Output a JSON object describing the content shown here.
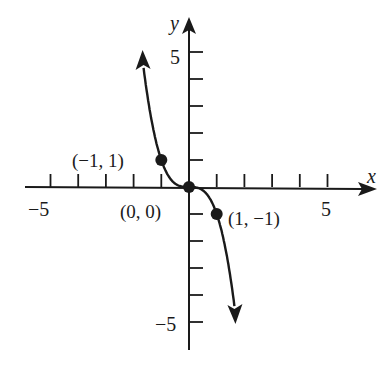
{
  "chart_data": {
    "type": "line",
    "title": "",
    "function": "y = -x^3",
    "xlabel": "x",
    "ylabel": "y",
    "xlim": [
      -6,
      6
    ],
    "ylim": [
      -6,
      6
    ],
    "grid": false,
    "x_tick_labels": [
      {
        "value": -5,
        "text": "−5"
      },
      {
        "value": 5,
        "text": "5"
      }
    ],
    "y_tick_labels": [
      {
        "value": 5,
        "text": "5"
      },
      {
        "value": -5,
        "text": "−5"
      }
    ],
    "x_ticks": [
      -5,
      -4,
      -3,
      -2,
      -1,
      1,
      2,
      3,
      4,
      5
    ],
    "y_ticks": [
      -5,
      -4,
      -3,
      -2,
      -1,
      1,
      2,
      3,
      4,
      5
    ],
    "series": [
      {
        "name": "curve",
        "x": [
          -1.64,
          -1.5,
          -1.25,
          -1,
          -0.75,
          -0.5,
          -0.25,
          0,
          0.25,
          0.5,
          0.75,
          1,
          1.25,
          1.5,
          1.64
        ],
        "y": [
          4.41,
          3.375,
          1.953,
          1,
          0.422,
          0.125,
          0.016,
          0,
          -0.016,
          -0.125,
          -0.422,
          -1,
          -1.953,
          -3.375,
          -4.41
        ]
      }
    ],
    "points": [
      {
        "x": -1,
        "y": 1,
        "label": "(−1, 1)"
      },
      {
        "x": 0,
        "y": 0,
        "label": "(0, 0)"
      },
      {
        "x": 1,
        "y": -1,
        "label": "(1, −1)"
      }
    ],
    "color": "#1a1a1a"
  }
}
